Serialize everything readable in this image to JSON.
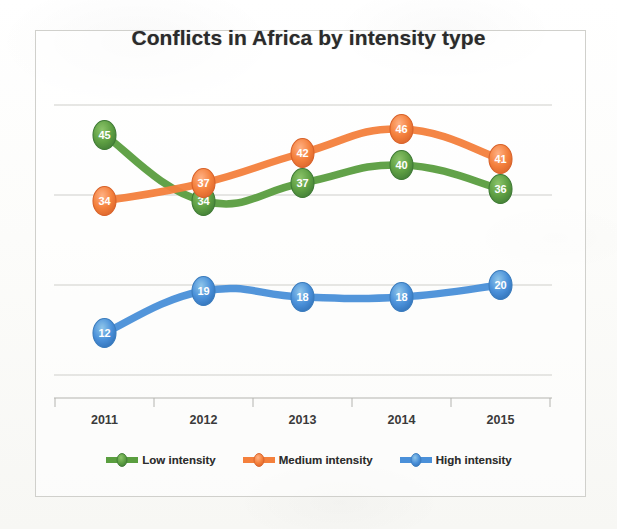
{
  "chart_data": {
    "type": "line",
    "title": "Conflicts in Africa by intensity type",
    "xlabel": "",
    "ylabel": "",
    "categories": [
      "2011",
      "2012",
      "2013",
      "2014",
      "2015"
    ],
    "series": [
      {
        "name": "Low intensity",
        "color": "#5a9e3f",
        "values": [
          45,
          34,
          37,
          40,
          36
        ]
      },
      {
        "name": "Medium intensity",
        "color": "#f4803c",
        "values": [
          34,
          37,
          42,
          46,
          41
        ]
      },
      {
        "name": "High intensity",
        "color": "#4a90d9",
        "values": [
          12,
          19,
          18,
          18,
          20
        ]
      }
    ],
    "ylim": [
      0,
      50
    ],
    "gridlines": [
      50,
      35,
      20,
      5
    ],
    "grid": true,
    "y_axis_labels_visible": false,
    "legend_position": "bottom",
    "data_labels": true,
    "line_style": "smooth",
    "marker_style": "oval"
  },
  "legend": {
    "items": [
      {
        "label": "Low intensity",
        "color": "#5a9e3f"
      },
      {
        "label": "Medium intensity",
        "color": "#f4803c"
      },
      {
        "label": "High intensity",
        "color": "#4a90d9"
      }
    ]
  }
}
